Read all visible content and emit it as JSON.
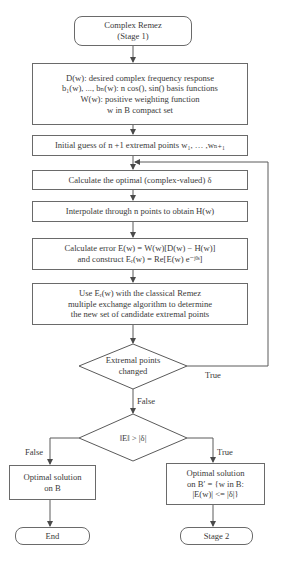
{
  "nodes": {
    "start": {
      "lines": [
        "Complex Remez",
        "(Stage 1)"
      ],
      "shape": "terminal"
    },
    "definitions": {
      "shape": "process",
      "lines": [
        "D(w): desired complex frequency response",
        "b₁(w), ..., bₙ(w): n cos(), sin() basis functions",
        "W(w): positive weighting function",
        "w in B compact set"
      ]
    },
    "initial_guess": {
      "shape": "process",
      "lines": [
        "Initial guess of n +1 extremal points w₁, … ,wₙ₊₁"
      ]
    },
    "calc_delta": {
      "shape": "process",
      "lines": [
        "Calculate the optimal (complex-valued) δ"
      ]
    },
    "interpolate": {
      "shape": "process",
      "lines": [
        "Interpolate through n points to obtain H(w)"
      ]
    },
    "calc_error": {
      "shape": "process",
      "lines": [
        "Calculate error E(w) = W(w)[D(w) − H(w)]",
        "and construct Eᵣ(w) = Re[E(w) e⁻ʲᶿˢ]"
      ]
    },
    "remez_exchange": {
      "shape": "process",
      "lines": [
        "Use Eᵣ(w) with the classical Remez",
        "multiple exchange algorithm to determine",
        "the new set of candidate extremal points"
      ]
    },
    "decision_changed": {
      "shape": "decision",
      "lines": [
        "Extremal points",
        "changed"
      ]
    },
    "decision_norm": {
      "shape": "decision",
      "lines": [
        "‖E‖ > |δ|"
      ]
    },
    "optimal_b": {
      "shape": "process",
      "lines": [
        "Optimal solution",
        "on B"
      ]
    },
    "optimal_bprime": {
      "shape": "process",
      "lines": [
        "Optimal solution",
        "on B′ = {w in B:",
        "|E(w)| <= |δ|}"
      ]
    },
    "end": {
      "shape": "terminal",
      "lines": [
        "End"
      ]
    },
    "stage2": {
      "shape": "terminal",
      "lines": [
        "Stage 2"
      ]
    }
  },
  "edge_labels": {
    "changed_true": "True",
    "changed_false": "False",
    "norm_false": "False",
    "norm_true": "True"
  },
  "colors": {
    "stroke": "#5a5a5a",
    "text": "#3a3a3a",
    "background": "#ffffff"
  }
}
